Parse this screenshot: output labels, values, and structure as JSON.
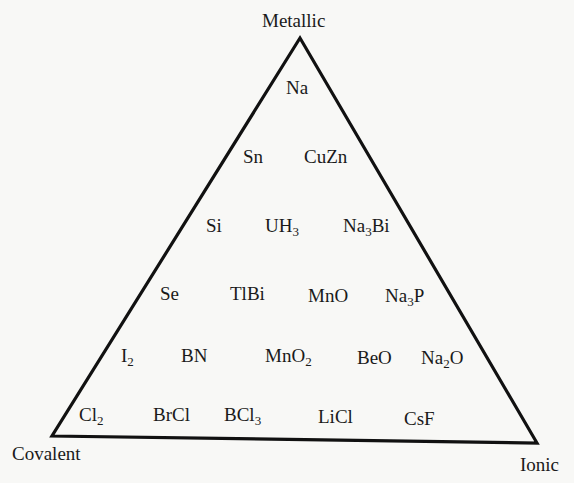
{
  "diagram": {
    "type": "van-arkel-ketelaar-triangle",
    "vertices": {
      "top": "Metallic",
      "bottom_left": "Covalent",
      "bottom_right": "Ionic"
    },
    "rows": [
      [
        {
          "base": "Na",
          "parts": [
            {
              "t": "Na"
            }
          ]
        }
      ],
      [
        {
          "parts": [
            {
              "t": "Sn"
            }
          ]
        },
        {
          "parts": [
            {
              "t": "CuZn"
            }
          ]
        }
      ],
      [
        {
          "parts": [
            {
              "t": "Si"
            }
          ]
        },
        {
          "parts": [
            {
              "t": "UH"
            },
            {
              "s": "3"
            }
          ]
        },
        {
          "parts": [
            {
              "t": "Na"
            },
            {
              "s": "3"
            },
            {
              "t": "Bi"
            }
          ]
        }
      ],
      [
        {
          "parts": [
            {
              "t": "Se"
            }
          ]
        },
        {
          "parts": [
            {
              "t": "TlBi"
            }
          ]
        },
        {
          "parts": [
            {
              "t": "MnO"
            }
          ]
        },
        {
          "parts": [
            {
              "t": "Na"
            },
            {
              "s": "3"
            },
            {
              "t": "P"
            }
          ]
        }
      ],
      [
        {
          "parts": [
            {
              "t": "I"
            },
            {
              "s": "2"
            }
          ]
        },
        {
          "parts": [
            {
              "t": "BN"
            }
          ]
        },
        {
          "parts": [
            {
              "t": "MnO"
            },
            {
              "s": "2"
            }
          ]
        },
        {
          "parts": [
            {
              "t": "BeO"
            }
          ]
        },
        {
          "parts": [
            {
              "t": "Na"
            },
            {
              "s": "2"
            },
            {
              "t": "O"
            }
          ]
        }
      ],
      [
        {
          "parts": [
            {
              "t": "Cl"
            },
            {
              "s": "2"
            }
          ]
        },
        {
          "parts": [
            {
              "t": "BrCl"
            }
          ]
        },
        {
          "parts": [
            {
              "t": "BCl"
            },
            {
              "s": "3"
            }
          ]
        },
        {
          "parts": [
            {
              "t": "LiCl"
            }
          ]
        },
        {
          "parts": [
            {
              "t": "CsF"
            }
          ]
        }
      ]
    ],
    "compounds_flat": [
      "Na",
      "Sn",
      "CuZn",
      "Si",
      "UH3",
      "Na3Bi",
      "Se",
      "TlBi",
      "MnO",
      "Na3P",
      "I2",
      "BN",
      "MnO2",
      "BeO",
      "Na2O",
      "Cl2",
      "BrCl",
      "BCl3",
      "LiCl",
      "CsF"
    ],
    "colors": {
      "background": "#f8f8f6",
      "line": "#111111",
      "text": "#1a1a1a"
    }
  }
}
